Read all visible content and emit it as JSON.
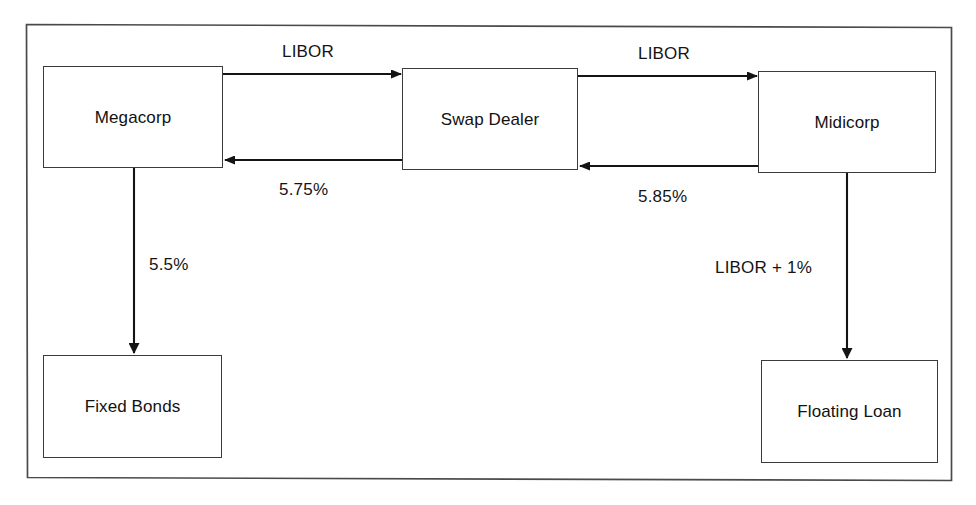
{
  "diagram": {
    "border_color": "#4a4a4a",
    "node_border_color": "#3b3b3b",
    "line_color": "#141414",
    "background_color": "#ffffff",
    "nodes": [
      {
        "id": "megacorp",
        "label": "Megacorp"
      },
      {
        "id": "swap-dealer",
        "label": "Swap Dealer"
      },
      {
        "id": "midicorp",
        "label": "Midicorp"
      },
      {
        "id": "fixed-bonds",
        "label": "Fixed Bonds"
      },
      {
        "id": "floating-loan",
        "label": "Floating Loan"
      }
    ],
    "edges": [
      {
        "id": "megacorp-to-dealer",
        "from": "megacorp",
        "to": "swap-dealer",
        "label": "LIBOR",
        "direction": "right"
      },
      {
        "id": "dealer-to-megacorp",
        "from": "swap-dealer",
        "to": "megacorp",
        "label": "5.75%",
        "direction": "left"
      },
      {
        "id": "dealer-to-midicorp",
        "from": "swap-dealer",
        "to": "midicorp",
        "label": "LIBOR",
        "direction": "right"
      },
      {
        "id": "midicorp-to-dealer",
        "from": "midicorp",
        "to": "swap-dealer",
        "label": "5.85%",
        "direction": "left"
      },
      {
        "id": "megacorp-to-fixed-bonds",
        "from": "megacorp",
        "to": "fixed-bonds",
        "label": "5.5%",
        "direction": "down"
      },
      {
        "id": "midicorp-to-floating-loan",
        "from": "midicorp",
        "to": "floating-loan",
        "label": "LIBOR + 1%",
        "direction": "down"
      }
    ]
  }
}
